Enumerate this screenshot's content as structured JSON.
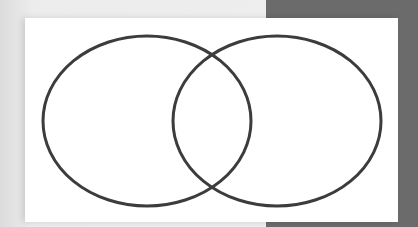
{
  "diagram": {
    "type": "venn",
    "sets": [
      {
        "name": "set-a",
        "label": "",
        "cx": 147,
        "cy": 121,
        "rx": 104,
        "ry": 85
      },
      {
        "name": "set-b",
        "label": "",
        "cx": 277,
        "cy": 121,
        "rx": 104,
        "ry": 85
      }
    ],
    "stroke_color": "#3c3c3c",
    "stroke_width": 3,
    "card_color": "#ffffff",
    "background_colors": {
      "left": "#eeeeee",
      "right": "#6b6b6b"
    }
  }
}
